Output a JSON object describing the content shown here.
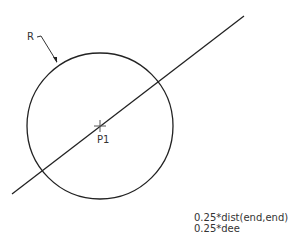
{
  "diagram": {
    "circle": {
      "cx": 100,
      "cy": 126,
      "r": 73
    },
    "line": {
      "x1": 12,
      "y1": 194,
      "x2": 244,
      "y2": 16
    },
    "center_point": {
      "x": 100,
      "y": 126,
      "label": "P1"
    },
    "radius_label": "R",
    "formula_lines": [
      "0.25*dist(end,end)",
      "0.25*dee"
    ],
    "colors": {
      "stroke": "#222222",
      "text": "#333333",
      "background": "#ffffff"
    }
  }
}
